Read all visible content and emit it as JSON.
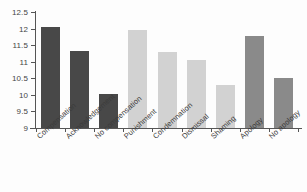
{
  "chart_data": {
    "type": "bar",
    "title": "",
    "subtitle": "",
    "xlabel": "",
    "ylabel": "",
    "ylim": [
      9,
      12.5
    ],
    "ytick_labels": [
      "12.5",
      "12",
      "11.5",
      "11",
      "10.5",
      "10",
      "9.5",
      "9"
    ],
    "yticks": [
      12.5,
      12,
      11.5,
      11,
      10.5,
      10,
      9.5,
      9
    ],
    "grid": false,
    "legend": "none",
    "categories": [
      "Compensation",
      "Acknowledgement",
      "No compensation",
      "Punishment",
      "Condemnation",
      "Dismissal",
      "Shaming",
      "Apology",
      "No apology"
    ],
    "values": [
      12.05,
      11.32,
      10.02,
      11.95,
      11.28,
      11.05,
      10.29,
      11.79,
      10.52
    ],
    "bar_colors": [
      "#484848",
      "#484848",
      "#484848",
      "#d2d2d2",
      "#d2d2d2",
      "#d2d2d2",
      "#d2d2d2",
      "#8a8a8a",
      "#8a8a8a"
    ],
    "axis_color": "#555555",
    "background_color": "#fdfdfd"
  }
}
